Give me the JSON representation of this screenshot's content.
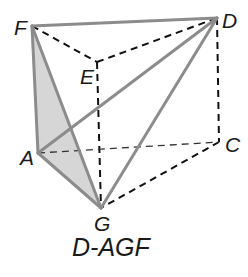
{
  "diagram": {
    "caption": "D-AGF",
    "points": {
      "F": {
        "label": "F",
        "x": 32,
        "y": 26
      },
      "D": {
        "label": "D",
        "x": 217,
        "y": 18
      },
      "E": {
        "label": "E",
        "x": 97,
        "y": 62
      },
      "C": {
        "label": "C",
        "x": 219,
        "y": 142
      },
      "A": {
        "label": "A",
        "x": 38,
        "y": 153
      },
      "G": {
        "label": "G",
        "x": 101,
        "y": 208
      }
    },
    "solid_edges": [
      "F-D",
      "F-A",
      "F-G",
      "A-G",
      "A-D",
      "D-G"
    ],
    "dashed_edges": [
      "F-E",
      "E-D",
      "E-G",
      "D-C",
      "C-G",
      "A-C"
    ],
    "shaded_face": [
      "F",
      "A",
      "G"
    ],
    "colors": {
      "solid_edge": "#8c8c8c",
      "dashed_edge": "#111111",
      "shaded_fill": "#d6d6d6",
      "label": "#1a1a1a"
    }
  }
}
